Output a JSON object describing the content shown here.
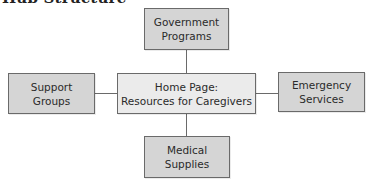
{
  "title": "Hub Structure",
  "colors": {
    "hub_fill": "#ebebeb",
    "node_fill": "#d5d5d5",
    "border": "#6a6a6a",
    "text": "#2a2a2a"
  },
  "hub": {
    "label": "Home Page:\nResources for Caregivers"
  },
  "nodes": {
    "top": {
      "label": "Government\nPrograms"
    },
    "left": {
      "label": "Support\nGroups"
    },
    "right": {
      "label": "Emergency\nServices"
    },
    "bottom": {
      "label": "Medical\nSupplies"
    }
  },
  "edges": [
    {
      "from": "hub",
      "to": "top"
    },
    {
      "from": "hub",
      "to": "left"
    },
    {
      "from": "hub",
      "to": "right"
    },
    {
      "from": "hub",
      "to": "bottom"
    }
  ]
}
